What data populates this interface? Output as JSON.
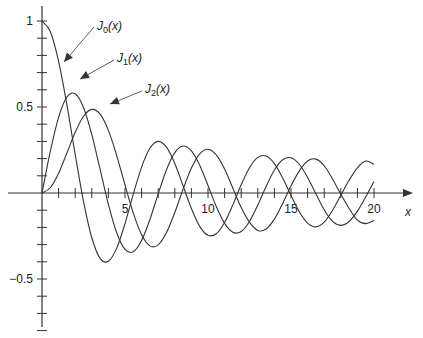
{
  "chart_data": {
    "type": "line",
    "title": "",
    "xlabel": "x",
    "ylabel": "",
    "xlim": [
      0,
      20
    ],
    "ylim": [
      -0.8,
      1.0
    ],
    "grid": false,
    "legend": "annotations with arrows",
    "x_ticks": [
      5,
      10,
      15,
      20
    ],
    "x_tick_labels": [
      "5",
      "10",
      "15",
      "20"
    ],
    "x_minor_ticks": [
      1,
      2,
      3,
      4,
      6,
      7,
      8,
      9,
      11,
      12,
      13,
      14,
      16,
      17,
      18,
      19
    ],
    "y_ticks": [
      1,
      0.5,
      -0.5
    ],
    "y_tick_labels": [
      "1",
      "0.5",
      "−0.5"
    ],
    "y_minor_step": 0.1,
    "x": [
      0,
      0.5,
      1,
      1.5,
      2,
      2.5,
      3,
      3.5,
      4,
      4.5,
      5,
      5.5,
      6,
      6.5,
      7,
      7.5,
      8,
      8.5,
      9,
      9.5,
      10,
      10.5,
      11,
      11.5,
      12,
      12.5,
      13,
      13.5,
      14,
      14.5,
      15,
      15.5,
      16,
      16.5,
      17,
      17.5,
      18,
      18.5,
      19,
      19.5,
      20
    ],
    "series": [
      {
        "name": "J0(x)",
        "label_main": "J",
        "label_sub": "0",
        "label_arg": "(x)",
        "values": [
          1,
          0.9385,
          0.7652,
          0.5118,
          0.2239,
          -0.0484,
          -0.2601,
          -0.3801,
          -0.3971,
          -0.3205,
          -0.1776,
          -0.0068,
          0.1506,
          0.2601,
          0.3001,
          0.2663,
          0.1717,
          0.0419,
          -0.0903,
          -0.1939,
          -0.2459,
          -0.2366,
          -0.1712,
          -0.0677,
          0.0477,
          0.1469,
          0.2069,
          0.215,
          0.1711,
          0.0875,
          -0.0142,
          -0.1092,
          -0.1749,
          -0.1969,
          -0.1699,
          -0.1022,
          -0.0134,
          0.0742,
          0.1466,
          0.1858,
          0.167
        ]
      },
      {
        "name": "J1(x)",
        "label_main": "J",
        "label_sub": "1",
        "label_arg": "(x)",
        "values": [
          0,
          0.2423,
          0.4401,
          0.5579,
          0.5767,
          0.4971,
          0.3391,
          0.1374,
          -0.066,
          -0.2311,
          -0.3276,
          -0.3414,
          -0.2767,
          -0.1538,
          -0.0047,
          0.1352,
          0.2346,
          0.2731,
          0.2453,
          0.1613,
          0.0435,
          -0.0789,
          -0.1768,
          -0.2284,
          -0.2234,
          -0.1655,
          -0.0703,
          0.038,
          0.1334,
          0.1934,
          0.2051,
          0.1672,
          0.0904,
          -0.0049,
          -0.0977,
          -0.1654,
          -0.188,
          -0.1655,
          -0.1057,
          -0.0229,
          0.0668
        ]
      },
      {
        "name": "J2(x)",
        "label_main": "J",
        "label_sub": "2",
        "label_arg": "(x)",
        "values": [
          0,
          0.0306,
          0.1149,
          0.2321,
          0.3528,
          0.4461,
          0.4861,
          0.4586,
          0.3641,
          0.2178,
          0.0466,
          -0.1173,
          -0.2429,
          -0.3074,
          -0.3014,
          -0.2303,
          -0.113,
          0.0223,
          0.1448,
          0.2279,
          0.2546,
          0.2216,
          0.139,
          0.0272,
          -0.0849,
          -0.1696,
          -0.2177,
          -0.2094,
          -0.152,
          -0.0609,
          0.0415,
          0.1286,
          0.1862,
          0.197,
          0.1584,
          0.0814,
          -0.0075,
          -0.0897,
          -0.1578,
          -0.1783,
          -0.1603
        ]
      }
    ],
    "annotations": [
      {
        "series": "J0(x)",
        "text_at": [
          97,
          30
        ],
        "arrow_to": [
          64,
          62
        ],
        "line_from": [
          94,
          27
        ]
      },
      {
        "series": "J1(x)",
        "text_at": [
          117,
          62
        ],
        "arrow_to": [
          80,
          79
        ],
        "line_from": [
          114,
          60
        ]
      },
      {
        "series": "J2(x)",
        "text_at": [
          145,
          93
        ],
        "arrow_to": [
          110,
          104
        ],
        "line_from": [
          142,
          91
        ]
      }
    ],
    "colors": {
      "line": "#333333",
      "axis": "#333333",
      "text": "#222222"
    }
  }
}
